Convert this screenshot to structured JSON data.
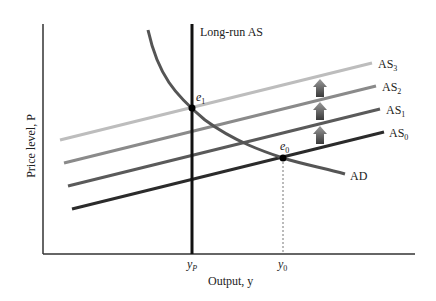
{
  "diagram": {
    "title": "",
    "axes": {
      "x_label": "Output, y",
      "y_label": "Price level, P",
      "x_ticks": [
        {
          "label": "y",
          "sub": "P",
          "name": "potential-output"
        },
        {
          "label": "y",
          "sub": "0",
          "name": "initial-output"
        }
      ]
    },
    "curves": {
      "long_run_as": {
        "label": "Long-run AS"
      },
      "ad": {
        "label": "AD"
      },
      "as": [
        {
          "label": "AS",
          "sub": "0",
          "color": "#2b2b2b"
        },
        {
          "label": "AS",
          "sub": "1",
          "color": "#5a5a5a"
        },
        {
          "label": "AS",
          "sub": "2",
          "color": "#8a8a8a"
        },
        {
          "label": "AS",
          "sub": "3",
          "color": "#bdbdbd"
        }
      ]
    },
    "points": [
      {
        "label": "e",
        "sub": "1",
        "name": "new-equilibrium"
      },
      {
        "label": "e",
        "sub": "0",
        "name": "initial-equilibrium"
      }
    ],
    "arrows_count": 3,
    "colors": {
      "axis": "#333333",
      "long_run_as": "#111111",
      "ad": "#555555",
      "arrow_top": "#9a9a9a",
      "arrow_bottom": "#3a3a3a"
    }
  }
}
